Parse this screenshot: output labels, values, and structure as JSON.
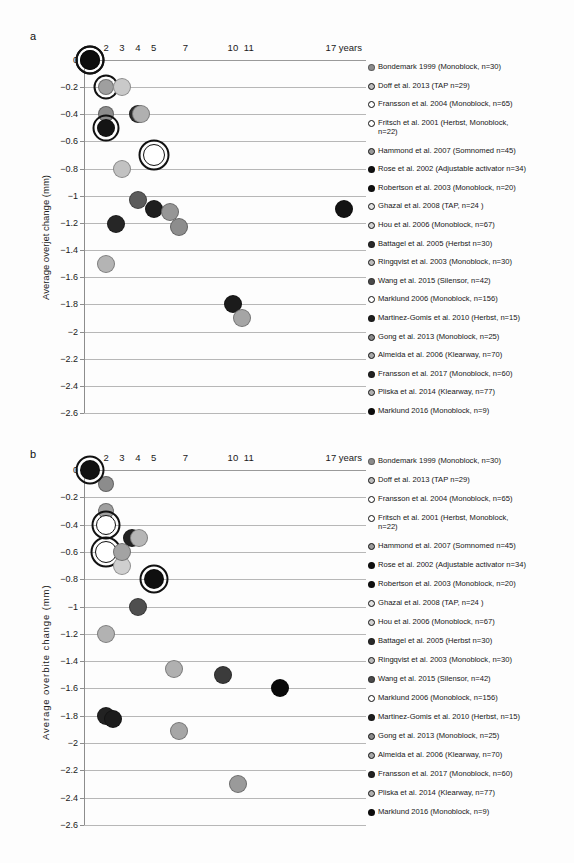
{
  "figure": {
    "width": 574,
    "height": 863,
    "background": "#fdfdfd"
  },
  "panels": [
    {
      "letter": "a",
      "ylabel": "Average overjet change (mm)",
      "xticks": [
        "2",
        "3",
        "4",
        "5",
        "7",
        "10",
        "11",
        "17 years"
      ],
      "yticks": [
        "0",
        "-0.2",
        "-0.4",
        "-0.6",
        "-0.8",
        "-1",
        "-1.2",
        "-1.4",
        "-1.6",
        "-1.8",
        "-2",
        "-2.2",
        "-2.4",
        "-2.6"
      ]
    },
    {
      "letter": "b",
      "ylabel": "Average overbite change (mm)",
      "xticks": [
        "2",
        "3",
        "4",
        "5",
        "7",
        "10",
        "11",
        "17 years"
      ],
      "yticks": [
        "0",
        "-0.2",
        "-0.4",
        "-0.6",
        "-0.8",
        "-1",
        "-1.2",
        "-1.4",
        "-1.6",
        "-1.8",
        "-2",
        "-2.2",
        "-2.4",
        "-2.6"
      ]
    }
  ],
  "legend_entries": [
    {
      "label": "Bondemark 1999 (Monoblock, n=30)",
      "fill": "#8c8c8c",
      "ring": false
    },
    {
      "label": "Doff et al. 2013 (TAP n=29)",
      "fill": "#bdbdbd",
      "ring": true
    },
    {
      "label": "Fransson et al. 2004 (Monoblock, n=65)",
      "fill": "#ffffff",
      "ring": true
    },
    {
      "label": "Fritsch et al. 2001 (Herbst, Monoblock,\n  n=22)",
      "fill": "#ffffff",
      "ring": true
    },
    {
      "label": "Hammond et al. 2007 (Somnomed n=45)",
      "fill": "#9a9a9a",
      "ring": true
    },
    {
      "label": "Rose et al. 2002 (Adjustable activator n=34)",
      "fill": "#111111",
      "ring": false
    },
    {
      "label": "Robertson et al. 2003 (Monoblock, n=20)",
      "fill": "#111111",
      "ring": false
    },
    {
      "label": "Ghazal et al. 2008 (TAP, n=24 )",
      "fill": "#e2e2e2",
      "ring": true
    },
    {
      "label": "Hou et al. 2006 (Monoblock, n=67)",
      "fill": "#d2d2d2",
      "ring": true
    },
    {
      "label": "Battagel et al. 2005 (Herbst n=30)",
      "fill": "#2a2a2a",
      "ring": false
    },
    {
      "label": "Ringqvist et al. 2003 (Monoblock, n=30)",
      "fill": "#bcbcbc",
      "ring": true
    },
    {
      "label": "Wang et al. 2015 (Silensor, n=42)",
      "fill": "#4a4a4a",
      "ring": false
    },
    {
      "label": "Marklund 2006 (Monoblock, n=156)",
      "fill": "#ffffff",
      "ring": true
    },
    {
      "label": "Martinez-Gomis et al. 2010 (Herbst, n=15)",
      "fill": "#1f1f1f",
      "ring": false
    },
    {
      "label": "Gong et al. 2013 (Monoblock, n=25)",
      "fill": "#8a8a8a",
      "ring": true
    },
    {
      "label": "Almeida et al. 2006 (Klearway, n=70)",
      "fill": "#a8a8a8",
      "ring": true
    },
    {
      "label": "Fransson et al. 2017 (Monoblock, n=60)",
      "fill": "#232323",
      "ring": false
    },
    {
      "label": "Pliska et al. 2014 (Klearway, n=77)",
      "fill": "#b0b0b0",
      "ring": true
    },
    {
      "label": "Marklund 2016 (Monoblock, n=9)",
      "fill": "#0d0d0d",
      "ring": false
    }
  ],
  "chart_data": [
    {
      "type": "scatter",
      "panel": "a",
      "title": "",
      "xlabel": "",
      "ylabel": "Average overjet change (mm)",
      "ylim": [
        -2.6,
        0
      ],
      "yticks": [
        0,
        -0.2,
        -0.4,
        -0.6,
        -0.8,
        -1,
        -1.2,
        -1.4,
        -1.6,
        -1.8,
        -2,
        -2.2,
        -2.4,
        -2.6
      ],
      "xticks": [
        2,
        3,
        4,
        5,
        7,
        10,
        11,
        17
      ],
      "xtick_labels": [
        "2",
        "3",
        "4",
        "5",
        "7",
        "10",
        "11",
        "17 years"
      ],
      "grid": true,
      "legend_position": "right",
      "points": [
        {
          "study": "Bondemark 1999 (Monoblock, n=30)",
          "x": 2,
          "y": -0.4,
          "fill": "#8c8c8c",
          "ring": false,
          "r": 8
        },
        {
          "study": "Doff et al. 2013 (TAP n=29)",
          "x": 2,
          "y": -0.2,
          "fill": "#9f9f9f",
          "ring": true,
          "r": 8
        },
        {
          "study": "Fransson et al. 2004 (Monoblock, n=65)",
          "x": 5,
          "y": -0.7,
          "fill": "#ffffff",
          "ring": true,
          "r": 11
        },
        {
          "study": "Fritsch et al. 2001 (Herbst, Monoblock, n=22)",
          "x": 1,
          "y": 0.0,
          "fill": "#111111",
          "ring": true,
          "r": 10
        },
        {
          "study": "Hammond et al. 2007 (Somnomed n=45)",
          "x": 2,
          "y": -0.5,
          "fill": "#141414",
          "ring": true,
          "r": 9
        },
        {
          "study": "Rose et al. 2002 (Adjustable activator n=34)",
          "x": 4,
          "y": -0.4,
          "fill": "#2c2c2c",
          "ring": false,
          "r": 9
        },
        {
          "study": "Robertson et al. 2003 (Monoblock, n=20)",
          "x": 5,
          "y": -1.1,
          "fill": "#1e1e1e",
          "ring": false,
          "r": 9
        },
        {
          "study": "Ghazal et al. 2008 (TAP, n=24 )",
          "x": 3,
          "y": -0.2,
          "fill": "#c9c9c9",
          "ring": false,
          "r": 9
        },
        {
          "study": "Hou et al. 2006 (Monoblock, n=67)",
          "x": 3,
          "y": -0.8,
          "fill": "#c2c2c2",
          "ring": false,
          "r": 9
        },
        {
          "study": "Battagel et al. 2005 (Herbst n=30)",
          "x": 2.6,
          "y": -1.21,
          "fill": "#262626",
          "ring": false,
          "r": 9
        },
        {
          "study": "Ringqvist et al. 2003 (Monoblock, n=30)",
          "x": 2,
          "y": -1.5,
          "fill": "#b4b4b4",
          "ring": false,
          "r": 9
        },
        {
          "study": "Wang et al. 2015 (Silensor, n=42)",
          "x": 4,
          "y": -1.03,
          "fill": "#5b5b5b",
          "ring": false,
          "r": 9
        },
        {
          "study": "Marklund 2006 (Monoblock, n=156)",
          "x": 4.2,
          "y": -0.4,
          "fill": "#b0b0b0",
          "ring": false,
          "r": 9
        },
        {
          "study": "Martinez-Gomis et al. 2010 (Herbst, n=15)",
          "x": 10,
          "y": -1.8,
          "fill": "#1b1b1b",
          "ring": false,
          "r": 9
        },
        {
          "study": "Gong et al. 2013 (Monoblock, n=25)",
          "x": 6,
          "y": -1.12,
          "fill": "#969696",
          "ring": false,
          "r": 9
        },
        {
          "study": "Almeida et al. 2006 (Klearway, n=70)",
          "x": 6.6,
          "y": -1.23,
          "fill": "#8d8d8d",
          "ring": false,
          "r": 9
        },
        {
          "study": "Fransson et al. 2017 (Monoblock, n=60)",
          "x": 17,
          "y": -1.1,
          "fill": "#131313",
          "ring": false,
          "r": 9
        },
        {
          "study": "Pliska et al. 2014 (Klearway, n=77)",
          "x": 10.6,
          "y": -1.9,
          "fill": "#a5a5a5",
          "ring": false,
          "r": 9
        },
        {
          "study": "Marklund 2016 (Monoblock, n=9)",
          "x": 1,
          "y": 0.0,
          "fill": "#0d0d0d",
          "ring": true,
          "r": 10
        }
      ]
    },
    {
      "type": "scatter",
      "panel": "b",
      "title": "",
      "xlabel": "",
      "ylabel": "Average overbite change (mm)",
      "ylim": [
        -2.6,
        0
      ],
      "yticks": [
        0,
        -0.2,
        -0.4,
        -0.6,
        -0.8,
        -1,
        -1.2,
        -1.4,
        -1.6,
        -1.8,
        -2,
        -2.2,
        -2.4,
        -2.6
      ],
      "xticks": [
        2,
        3,
        4,
        5,
        7,
        10,
        11,
        17
      ],
      "xtick_labels": [
        "2",
        "3",
        "4",
        "5",
        "7",
        "10",
        "11",
        "17 years"
      ],
      "grid": true,
      "legend_position": "right",
      "points": [
        {
          "study": "Bondemark 1999 (Monoblock, n=30)",
          "x": 2,
          "y": -0.1,
          "fill": "#8c8c8c",
          "ring": false,
          "r": 8
        },
        {
          "study": "Doff et al. 2013 (TAP n=29)",
          "x": 2,
          "y": -0.3,
          "fill": "#9f9f9f",
          "ring": false,
          "r": 8
        },
        {
          "study": "Fransson et al. 2004 (Monoblock, n=65)",
          "x": 2,
          "y": -0.4,
          "fill": "#ffffff",
          "ring": true,
          "r": 10
        },
        {
          "study": "Fritsch et al. 2001 (Herbst, Monoblock, n=22)",
          "x": 2,
          "y": -0.6,
          "fill": "#ffffff",
          "ring": true,
          "r": 11
        },
        {
          "study": "Hammond et al. 2007 (Somnomed n=45)",
          "x": 1,
          "y": 0.0,
          "fill": "#111111",
          "ring": true,
          "r": 10
        },
        {
          "study": "Rose et al. 2002 (Adjustable activator n=34)",
          "x": 3.6,
          "y": -0.5,
          "fill": "#222222",
          "ring": false,
          "r": 9
        },
        {
          "study": "Robertson et al. 2003 (Monoblock, n=20)",
          "x": 5,
          "y": -0.8,
          "fill": "#0f0f0f",
          "ring": true,
          "r": 10
        },
        {
          "study": "Ghazal et al. 2008 (TAP, n=24 )",
          "x": 4.1,
          "y": -0.5,
          "fill": "#b6b6b6",
          "ring": false,
          "r": 9
        },
        {
          "study": "Hou et al. 2006 (Monoblock, n=67)",
          "x": 3,
          "y": -0.7,
          "fill": "#cfcfcf",
          "ring": false,
          "r": 9
        },
        {
          "study": "Battagel et al. 2005 (Herbst n=30)",
          "x": 2,
          "y": -1.8,
          "fill": "#222222",
          "ring": false,
          "r": 9
        },
        {
          "study": "Ringqvist et al. 2003 (Monoblock, n=30)",
          "x": 3,
          "y": -0.6,
          "fill": "#a3a3a3",
          "ring": false,
          "r": 9
        },
        {
          "study": "Wang et al. 2015 (Silensor, n=42)",
          "x": 4,
          "y": -1.0,
          "fill": "#4f4f4f",
          "ring": false,
          "r": 9
        },
        {
          "study": "Marklund 2006 (Monoblock, n=156)",
          "x": 2,
          "y": -1.2,
          "fill": "#b2b2b2",
          "ring": false,
          "r": 9
        },
        {
          "study": "Martinez-Gomis et al. 2010 (Herbst, n=15)",
          "x": 2.4,
          "y": -1.82,
          "fill": "#1c1c1c",
          "ring": false,
          "r": 9
        },
        {
          "study": "Gong et al. 2013 (Monoblock, n=25)",
          "x": 6.3,
          "y": -1.46,
          "fill": "#b0b0b0",
          "ring": false,
          "r": 9
        },
        {
          "study": "Almeida et al. 2006 (Klearway, n=70)",
          "x": 6.6,
          "y": -1.91,
          "fill": "#a6a6a6",
          "ring": false,
          "r": 9
        },
        {
          "study": "Fransson et al. 2017 (Monoblock, n=60)",
          "x": 9.4,
          "y": -1.5,
          "fill": "#3b3b3b",
          "ring": false,
          "r": 9
        },
        {
          "study": "Pliska et al. 2014 (Klearway, n=77)",
          "x": 10.3,
          "y": -2.3,
          "fill": "#9a9a9a",
          "ring": false,
          "r": 9
        },
        {
          "study": "Marklund 2016 (Monoblock, n=9)",
          "x": 13,
          "y": -1.6,
          "fill": "#0a0a0a",
          "ring": false,
          "r": 9
        }
      ]
    }
  ]
}
